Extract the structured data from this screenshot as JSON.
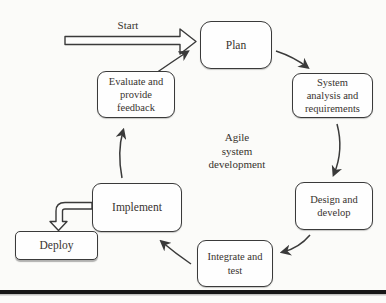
{
  "figure": {
    "start_label": "Start",
    "center_label": "Agile\nsystem\ndevelopment",
    "nodes": {
      "plan": "Plan",
      "system_analysis": "System\nanalysis and\nrequirements",
      "design_develop": "Design and\ndevelop",
      "integrate_test": "Integrate and\ntest",
      "implement": "Implement",
      "deploy": "Deploy",
      "evaluate_feedback": "Evaluate and\nprovide\nfeedback"
    },
    "colors": {
      "stroke": "#3a3a3a",
      "text": "#38332e",
      "background": "#fbfbf9",
      "box_fill": "#fefefe",
      "bottom_rule": "#161616"
    }
  }
}
